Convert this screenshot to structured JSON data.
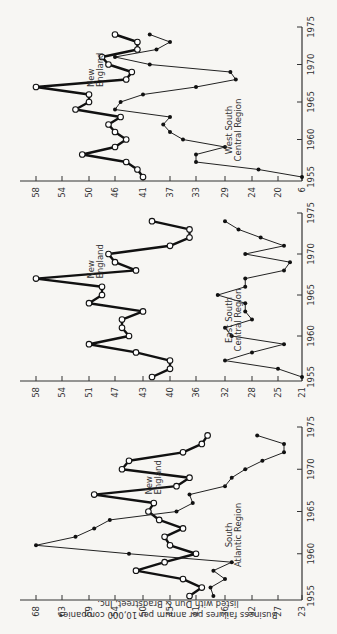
{
  "figure": {
    "ylabel_line1": "Business failures per annum per 10,000 companies",
    "ylabel_line2": "listed with Dun & Bradstreet, Inc."
  },
  "chart_data": [
    {
      "type": "line",
      "title": "New England vs South Atlantic Region",
      "xlabel": "",
      "ylabel": "Business failures per annum per 10,000 companies listed with Dun & Bradstreet, Inc.",
      "x_ticks": [
        "1955",
        "1960",
        "1965",
        "1970",
        "1975"
      ],
      "y_ticks": [
        68,
        63,
        59,
        54,
        50,
        45,
        41,
        36,
        32,
        27,
        23
      ],
      "ylim": [
        23,
        68
      ],
      "x": [
        1955,
        1956,
        1957,
        1958,
        1959,
        1960,
        1961,
        1962,
        1963,
        1964,
        1965,
        1966,
        1967,
        1968,
        1969,
        1970,
        1971,
        1972,
        1973,
        1974
      ],
      "series": [
        {
          "name": "New England",
          "marker": "open-circle",
          "label": "New\nEngland",
          "values": [
            42,
            40,
            43,
            51,
            46,
            41,
            45,
            46,
            43,
            47,
            49,
            48,
            58,
            44,
            42,
            53,
            52,
            43,
            40,
            39
          ]
        },
        {
          "name": "South Atlantic Region",
          "marker": "filled-circle",
          "label": "South\nAtlantic Region",
          "values": [
            38,
            38.5,
            36,
            38,
            35,
            52,
            68,
            61,
            58,
            55,
            44,
            41.5,
            42,
            36,
            35,
            33,
            30,
            26,
            26,
            31
          ]
        }
      ]
    },
    {
      "type": "line",
      "title": "New England vs East South Central Region",
      "x_ticks": [
        "1955",
        "1960",
        "1965",
        "1970",
        "1975"
      ],
      "y_ticks": [
        58,
        54,
        51,
        47,
        43,
        40,
        36,
        32,
        28,
        25,
        21
      ],
      "ylim": [
        21,
        58
      ],
      "x": [
        1955,
        1956,
        1957,
        1958,
        1959,
        1960,
        1961,
        1962,
        1963,
        1964,
        1965,
        1966,
        1967,
        1968,
        1969,
        1970,
        1971,
        1972,
        1973,
        1974
      ],
      "series": [
        {
          "name": "New England",
          "marker": "open-circle",
          "label": "New\nEngland",
          "values": [
            42,
            40,
            40,
            44,
            51,
            45,
            46,
            46,
            43,
            51,
            49,
            49,
            58,
            44,
            47,
            48,
            40,
            37,
            37,
            42
          ]
        },
        {
          "name": "East South Central Region",
          "marker": "filled-circle",
          "label": "East South\nCentral Region",
          "values": [
            21,
            25,
            32,
            28,
            24,
            31,
            32,
            28,
            29,
            29,
            33,
            29,
            29,
            24,
            23,
            29,
            24,
            27,
            30,
            32
          ]
        }
      ]
    },
    {
      "type": "line",
      "title": "New England vs West South Central Region",
      "x_ticks": [
        "1955",
        "1960",
        "1965",
        "1970",
        "1975"
      ],
      "y_ticks": [
        58,
        54,
        50,
        46,
        41,
        37,
        33,
        29,
        24,
        20,
        6
      ],
      "ylim": [
        6,
        58
      ],
      "x": [
        1955,
        1956,
        1957,
        1958,
        1959,
        1960,
        1961,
        1962,
        1963,
        1964,
        1965,
        1966,
        1967,
        1968,
        1969,
        1970,
        1971,
        1972,
        1973,
        1974
      ],
      "series": [
        {
          "name": "New England",
          "marker": "open-circle",
          "label": "New\nEngland",
          "values": [
            41,
            42,
            44,
            51,
            46,
            44,
            46,
            47,
            45,
            52,
            50,
            50,
            58,
            44,
            43,
            47,
            48,
            42,
            42,
            46
          ]
        },
        {
          "name": "West South Central Region",
          "marker": "filled-circle",
          "label": "West South\nCentral Region",
          "values": [
            6,
            23,
            33,
            33,
            29,
            35,
            37,
            38,
            37,
            46,
            45,
            41,
            33,
            27,
            28,
            40,
            46,
            39,
            37,
            40
          ]
        }
      ]
    }
  ]
}
